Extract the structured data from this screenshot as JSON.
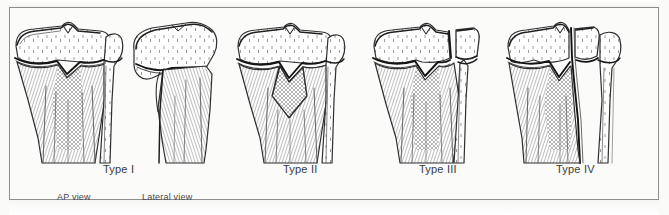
{
  "figure": {
    "kind": "medical-illustration",
    "background_color": "#fbfbfa",
    "ink_color": "#3a3a3a",
    "border_color": "#8d8d8d"
  },
  "panels": [
    {
      "id": "type-1",
      "label": "Type I",
      "label_x": 125,
      "label_y": 170,
      "views": [
        "AP view",
        "Lateral view"
      ],
      "description": "Fracture through the physis only; epiphysis separated from metaphysis"
    },
    {
      "id": "type-2",
      "label": "Type II",
      "label_x": 307,
      "label_y": 170,
      "views": [],
      "description": "Fracture through physis exiting through a triangular metaphyseal fragment"
    },
    {
      "id": "type-3",
      "label": "Type III",
      "label_x": 443,
      "label_y": 170,
      "views": [],
      "description": "Fracture through physis exiting through the epiphysis into the joint"
    },
    {
      "id": "type-4",
      "label": "Type IV",
      "label_x": 578,
      "label_y": 170,
      "views": [],
      "description": "Fracture crossing metaphysis, physis and epiphysis"
    }
  ],
  "view_labels": [
    {
      "id": "ap-view",
      "text": "AP view",
      "x": 57,
      "y": 193
    },
    {
      "id": "lateral-view",
      "text": "Lateral view",
      "x": 142,
      "y": 193
    }
  ],
  "anatomy": {
    "bones": [
      "tibia",
      "fibula"
    ],
    "landmarks": [
      "tibial plateau",
      "intercondylar eminence",
      "proximal tibial physis",
      "metaphysis",
      "diaphysis",
      "fibular head"
    ]
  }
}
